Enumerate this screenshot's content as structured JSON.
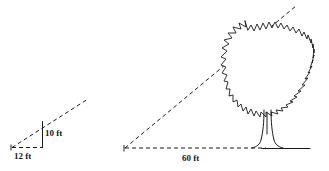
{
  "diagram": {
    "background_color": "#ffffff",
    "line_color": "#1a1a1a",
    "width": 329,
    "height": 171
  },
  "small_triangle": {
    "name": "small-reference-triangle",
    "base_label": "12 ft",
    "height_label": "10 ft",
    "base_value": 12,
    "height_value": 10,
    "units": "ft",
    "base_style": "dashed",
    "height_style": "solid",
    "hypotenuse_style": "dashed",
    "vertex_left_x": 12,
    "vertex_left_y": 147,
    "vertex_corner_x": 42,
    "vertex_corner_y": 147,
    "vertex_top_x": 42,
    "vertex_top_y": 122,
    "hypotenuse_end_x": 88,
    "hypotenuse_end_y": 99
  },
  "large_triangle": {
    "name": "large-tree-triangle",
    "base_label": "60 ft",
    "base_value": 60,
    "units": "ft",
    "base_style": "dashed",
    "ground_style": "solid",
    "hypotenuse_style": "dashed",
    "vertex_left_x": 125,
    "vertex_left_y": 148,
    "hypotenuse_end_x": 296,
    "hypotenuse_end_y": 6,
    "ground_start_x": 125,
    "ground_end_x": 310,
    "ground_y": 148
  },
  "tree": {
    "name": "tree-illustration",
    "canopy_center_x": 270,
    "canopy_center_y": 72,
    "canopy_radius_x": 43,
    "canopy_radius_y": 50,
    "trunk_base_x": 268,
    "trunk_base_y": 148,
    "canopy_style": "jagged-outline",
    "trunk_style": "flared-base"
  },
  "labels": {
    "small_base": "12 ft",
    "small_height": "10 ft",
    "large_base": "60 ft"
  }
}
